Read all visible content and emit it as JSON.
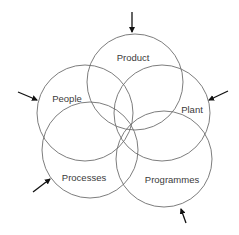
{
  "diagram": {
    "type": "overlapping-circles",
    "colors": {
      "circle_stroke": "#6e6e6e",
      "arrow": "#111111",
      "text": "#3a3a3a",
      "background": "#ffffff"
    },
    "circles": [
      {
        "id": "product",
        "label": "Product",
        "cx": 135,
        "cy": 82,
        "r": 48,
        "label_x": 133,
        "label_y": 58
      },
      {
        "id": "people",
        "label": "People",
        "cx": 85,
        "cy": 113,
        "r": 48,
        "label_x": 67,
        "label_y": 99
      },
      {
        "id": "plant",
        "label": "Plant",
        "cx": 162,
        "cy": 113,
        "r": 48,
        "label_x": 192,
        "label_y": 110
      },
      {
        "id": "processes",
        "label": "Processes",
        "cx": 90,
        "cy": 150,
        "r": 48,
        "label_x": 84,
        "label_y": 178
      },
      {
        "id": "programmes",
        "label": "Programmes",
        "cx": 164,
        "cy": 159,
        "r": 48,
        "label_x": 172,
        "label_y": 180
      }
    ],
    "arrows": [
      {
        "id": "arrow-top",
        "x1": 132,
        "y1": 12,
        "x2": 132,
        "y2": 32
      },
      {
        "id": "arrow-left",
        "x1": 18,
        "y1": 92,
        "x2": 37,
        "y2": 100
      },
      {
        "id": "arrow-right",
        "x1": 228,
        "y1": 91,
        "x2": 209,
        "y2": 100
      },
      {
        "id": "arrow-bottom-left",
        "x1": 33,
        "y1": 192,
        "x2": 50,
        "y2": 179
      },
      {
        "id": "arrow-bottom-right",
        "x1": 186,
        "y1": 223,
        "x2": 181,
        "y2": 209
      }
    ]
  }
}
